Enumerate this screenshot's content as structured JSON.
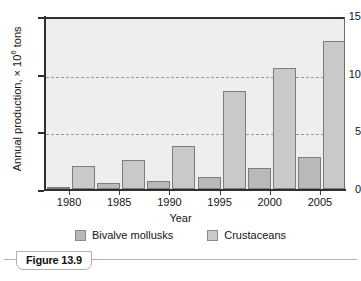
{
  "figure": {
    "caption_label": "Figure 13.9"
  },
  "legend": {
    "items": [
      {
        "label": "Bivalve mollusks",
        "color": "#b9b9b9"
      },
      {
        "label": "Crustaceans",
        "color": "#c9c9c9"
      }
    ]
  },
  "axes": {
    "x_title": "Year",
    "y_title_prefix": "Annual production, × 10",
    "y_title_exponent": "6",
    "y_title_suffix": " tons",
    "y_ticks": [
      "0",
      "5",
      "10",
      "15"
    ],
    "x_ticks": [
      "1980",
      "1985",
      "1990",
      "1995",
      "2000",
      "2005"
    ]
  },
  "chart_data": {
    "type": "bar",
    "title": "",
    "xlabel": "Year",
    "ylabel": "Annual production, × 10⁶ tons",
    "categories": [
      "1980",
      "1985",
      "1990",
      "1995",
      "2000",
      "2005"
    ],
    "series": [
      {
        "name": "Bivalve mollusks",
        "color": "#b9b9b9",
        "values": [
          0.2,
          0.5,
          0.7,
          1.0,
          1.8,
          2.8
        ]
      },
      {
        "name": "Crustaceans",
        "color": "#c9c9c9",
        "values": [
          2.0,
          2.5,
          3.7,
          8.5,
          10.5,
          12.8
        ]
      }
    ],
    "ylim": [
      0,
      15
    ],
    "yticks": [
      0,
      5,
      10,
      15
    ],
    "gridlines": [
      5,
      10
    ],
    "grid": true,
    "grid_style": "dashed",
    "legend_position": "bottom",
    "plot_background": "#eeeeee"
  }
}
